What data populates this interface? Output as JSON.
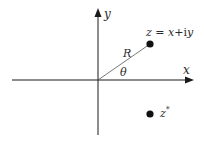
{
  "diagram": {
    "axes": {
      "x_label": "x",
      "y_label": "y",
      "origin": [
        98,
        80
      ]
    },
    "points": [
      {
        "id": "z",
        "label_parts": [
          "z",
          " = ",
          "x",
          "+i",
          "y"
        ],
        "position": [
          150,
          44
        ]
      },
      {
        "id": "z_conjugate",
        "label_base": "z",
        "label_sup": "*",
        "position": [
          150,
          114
        ]
      }
    ],
    "annotations": {
      "radius_label": "R",
      "angle_label": "θ"
    },
    "colors": {
      "ink": "#1a1a1a",
      "radius_line": "#555555",
      "background": "#ffffff"
    }
  }
}
